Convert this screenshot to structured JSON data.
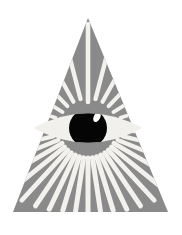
{
  "image": {
    "title": "Eye of Providence",
    "subject": "all-seeing-eye",
    "width": 182,
    "height": 235,
    "background_color": "#ffffff"
  },
  "colors": {
    "background": "#ffffff",
    "triangle_fill": "#8a8a8a",
    "ray_fill": "#f2f1ee",
    "sclera_fill": "#f2f0ed",
    "pupil_fill": "#050505",
    "highlight_fill": "#fdfdfb"
  },
  "triangle": {
    "label": "gray-triangle",
    "apex": {
      "x": 88,
      "y": 18
    },
    "bottom_left": {
      "x": 13,
      "y": 212
    },
    "bottom_right": {
      "x": 168,
      "y": 212
    },
    "fill": "#8a8a8a"
  },
  "eye": {
    "label": "all-seeing-eye",
    "center": {
      "x": 88,
      "y": 128
    },
    "left_tip": {
      "x": 34,
      "y": 128
    },
    "right_tip": {
      "x": 143,
      "y": 128
    },
    "sclera_half_width": 54.5,
    "sclera_half_height": 22,
    "pupil": {
      "label": "pupil",
      "center": {
        "x": 88,
        "y": 128
      },
      "radius": 19,
      "fill": "#050505"
    },
    "highlight": {
      "label": "catchlight",
      "center": {
        "x": 97,
        "y": 117
      },
      "radius_x": 3.2,
      "radius_y": 5.4,
      "rotation": 28,
      "fill": "#fdfdfb"
    }
  },
  "rays": {
    "label": "radiating-light-rays",
    "origin": {
      "x": 88,
      "y": 128
    },
    "fill": "#f2f1ee",
    "count_upper": 11,
    "count_lower": 21,
    "upper": [
      {
        "angle": -90.0,
        "inner": 26,
        "outer": 104,
        "width": 4.6
      },
      {
        "angle": -75.5,
        "inner": 30,
        "outer": 86,
        "width": 4.4
      },
      {
        "angle": -61.0,
        "inner": 30,
        "outer": 72,
        "width": 4.2
      },
      {
        "angle": -46.5,
        "inner": 30,
        "outer": 62,
        "width": 4.0
      },
      {
        "angle": -32.0,
        "inner": 30,
        "outer": 54,
        "width": 3.8
      },
      {
        "angle": -17.5,
        "inner": 34,
        "outer": 50,
        "width": 3.6
      },
      {
        "angle": -104.5,
        "inner": 30,
        "outer": 86,
        "width": 4.4
      },
      {
        "angle": -119.0,
        "inner": 30,
        "outer": 72,
        "width": 4.2
      },
      {
        "angle": -133.5,
        "inner": 30,
        "outer": 62,
        "width": 4.0
      },
      {
        "angle": -148.0,
        "inner": 30,
        "outer": 54,
        "width": 3.8
      },
      {
        "angle": -162.5,
        "inner": 34,
        "outer": 50,
        "width": 3.6
      }
    ],
    "lower": [
      {
        "angle": 90.0,
        "inner": 30,
        "outer": 84,
        "width": 5.0
      },
      {
        "angle": 81.5,
        "inner": 30,
        "outer": 84,
        "width": 5.0
      },
      {
        "angle": 73.0,
        "inner": 30,
        "outer": 86,
        "width": 5.0
      },
      {
        "angle": 64.5,
        "inner": 30,
        "outer": 90,
        "width": 5.0
      },
      {
        "angle": 56.0,
        "inner": 30,
        "outer": 94,
        "width": 4.9
      },
      {
        "angle": 47.5,
        "inner": 30,
        "outer": 98,
        "width": 4.8
      },
      {
        "angle": 39.0,
        "inner": 30,
        "outer": 92,
        "width": 4.7
      },
      {
        "angle": 30.5,
        "inner": 30,
        "outer": 78,
        "width": 4.6
      },
      {
        "angle": 22.0,
        "inner": 32,
        "outer": 66,
        "width": 4.4
      },
      {
        "angle": 13.5,
        "inner": 36,
        "outer": 58,
        "width": 4.2
      },
      {
        "angle": 98.5,
        "inner": 30,
        "outer": 84,
        "width": 5.0
      },
      {
        "angle": 107.0,
        "inner": 30,
        "outer": 86,
        "width": 5.0
      },
      {
        "angle": 115.5,
        "inner": 30,
        "outer": 90,
        "width": 5.0
      },
      {
        "angle": 124.0,
        "inner": 30,
        "outer": 94,
        "width": 4.9
      },
      {
        "angle": 132.5,
        "inner": 30,
        "outer": 98,
        "width": 4.8
      },
      {
        "angle": 141.0,
        "inner": 30,
        "outer": 92,
        "width": 4.7
      },
      {
        "angle": 149.5,
        "inner": 30,
        "outer": 78,
        "width": 4.6
      },
      {
        "angle": 158.0,
        "inner": 32,
        "outer": 66,
        "width": 4.4
      },
      {
        "angle": 166.5,
        "inner": 36,
        "outer": 58,
        "width": 4.2
      },
      {
        "angle": 4.0,
        "inner": 40,
        "outer": 54,
        "width": 4.0
      },
      {
        "angle": 176.0,
        "inner": 40,
        "outer": 54,
        "width": 4.0
      }
    ]
  }
}
